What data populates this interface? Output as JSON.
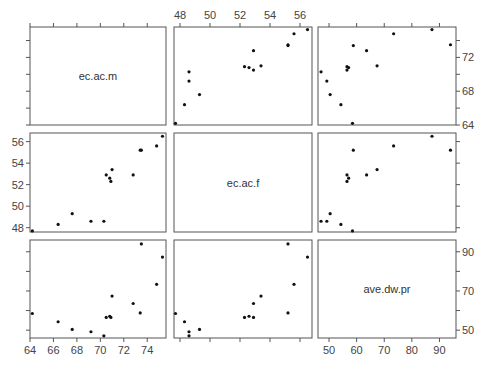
{
  "chart_data": {
    "type": "scatter",
    "subtype": "scatterplot-matrix",
    "variables": [
      "ec.ac.m",
      "ec.ac.f",
      "ave.dw.pr"
    ],
    "axes": {
      "ec.ac.m": {
        "range": [
          64,
          75.6
        ],
        "ticks": [
          64,
          66,
          68,
          70,
          72,
          74
        ],
        "tick_labels_on": [
          "bottom",
          "right"
        ],
        "right_labels": [
          64,
          68,
          72
        ]
      },
      "ec.ac.f": {
        "range": [
          47.6,
          56.8
        ],
        "ticks": [
          48,
          50,
          52,
          54,
          56
        ],
        "tick_labels_on": [
          "top",
          "left"
        ]
      },
      "ave.dw.pr": {
        "range": [
          46,
          96
        ],
        "ticks": [
          50,
          60,
          70,
          80,
          90
        ],
        "tick_labels_on": [
          "bottom",
          "right"
        ],
        "right_labels": [
          50,
          70,
          90
        ]
      }
    },
    "observations": [
      {
        "ec.ac.m": 64.2,
        "ec.ac.f": 47.7,
        "ave.dw.pr": 58.5
      },
      {
        "ec.ac.m": 66.4,
        "ec.ac.f": 48.3,
        "ave.dw.pr": 54.3
      },
      {
        "ec.ac.m": 67.6,
        "ec.ac.f": 49.3,
        "ave.dw.pr": 50.4
      },
      {
        "ec.ac.m": 69.2,
        "ec.ac.f": 48.6,
        "ave.dw.pr": 49.2
      },
      {
        "ec.ac.m": 70.3,
        "ec.ac.f": 48.6,
        "ave.dw.pr": 47.1
      },
      {
        "ec.ac.m": 70.5,
        "ec.ac.f": 52.9,
        "ave.dw.pr": 56.5
      },
      {
        "ec.ac.m": 70.8,
        "ec.ac.f": 52.6,
        "ave.dw.pr": 57.1
      },
      {
        "ec.ac.m": 70.9,
        "ec.ac.f": 52.3,
        "ave.dw.pr": 56.5
      },
      {
        "ec.ac.m": 71.0,
        "ec.ac.f": 53.4,
        "ave.dw.pr": 67.4
      },
      {
        "ec.ac.m": 72.8,
        "ec.ac.f": 52.9,
        "ave.dw.pr": 63.6
      },
      {
        "ec.ac.m": 73.4,
        "ec.ac.f": 55.2,
        "ave.dw.pr": 58.8
      },
      {
        "ec.ac.m": 73.5,
        "ec.ac.f": 55.2,
        "ave.dw.pr": 94.0
      },
      {
        "ec.ac.m": 74.8,
        "ec.ac.f": 55.6,
        "ave.dw.pr": 73.4
      },
      {
        "ec.ac.m": 75.3,
        "ec.ac.f": 56.5,
        "ave.dw.pr": 87.3
      }
    ],
    "title": "",
    "grid": false,
    "legend": "none"
  }
}
